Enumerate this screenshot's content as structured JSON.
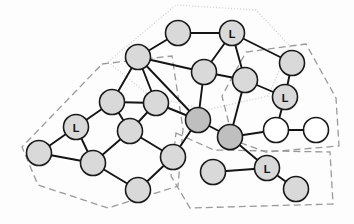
{
  "figure": {
    "name": "network-cluster-diagram",
    "kind": "node-link-graph",
    "width": 354,
    "height": 224,
    "background_color": "#fdfdfd"
  },
  "style": {
    "node_fill_gray": "#d9d9d9",
    "node_fill_dark": "#bfbfbf",
    "node_fill_white": "#ffffff",
    "node_stroke": "#1a1a1a",
    "node_stroke_width": 1.6,
    "node_radius": 12.5,
    "edge_color": "#141414",
    "edge_width": 1.9,
    "cluster_stroke": "#9a9a9a",
    "cluster_stroke_light": "#cccccc",
    "cluster_stroke_width": 1.3,
    "label_color": "#111111",
    "label_font_size": 11
  },
  "nodes": [
    {
      "id": "n1",
      "label": "",
      "x": 178,
      "y": 33,
      "fill": "#d9d9d9"
    },
    {
      "id": "n2",
      "label": "L",
      "x": 232,
      "y": 33,
      "fill": "#d9d9d9"
    },
    {
      "id": "n3",
      "label": "",
      "x": 138,
      "y": 57,
      "fill": "#d9d9d9"
    },
    {
      "id": "n4",
      "label": "",
      "x": 204,
      "y": 72,
      "fill": "#d9d9d9"
    },
    {
      "id": "n5",
      "label": "",
      "x": 245,
      "y": 80,
      "fill": "#d9d9d9"
    },
    {
      "id": "n6",
      "label": "",
      "x": 292,
      "y": 63,
      "fill": "#d9d9d9"
    },
    {
      "id": "n7",
      "label": "L",
      "x": 285,
      "y": 97,
      "fill": "#d9d9d9"
    },
    {
      "id": "n8",
      "label": "",
      "x": 112,
      "y": 102,
      "fill": "#d9d9d9"
    },
    {
      "id": "n9",
      "label": "",
      "x": 156,
      "y": 103,
      "fill": "#d9d9d9"
    },
    {
      "id": "n10",
      "label": "",
      "x": 198,
      "y": 120,
      "fill": "#bfbfbf"
    },
    {
      "id": "n11",
      "label": "L",
      "x": 76,
      "y": 127,
      "fill": "#d9d9d9"
    },
    {
      "id": "n12",
      "label": "",
      "x": 130,
      "y": 131,
      "fill": "#d9d9d9"
    },
    {
      "id": "n13",
      "label": "",
      "x": 230,
      "y": 137,
      "fill": "#bfbfbf"
    },
    {
      "id": "n14",
      "label": "",
      "x": 276,
      "y": 130,
      "fill": "#ffffff"
    },
    {
      "id": "n15",
      "label": "",
      "x": 316,
      "y": 130,
      "fill": "#ffffff"
    },
    {
      "id": "n16",
      "label": "",
      "x": 39,
      "y": 153,
      "fill": "#d9d9d9"
    },
    {
      "id": "n17",
      "label": "",
      "x": 93,
      "y": 163,
      "fill": "#d9d9d9"
    },
    {
      "id": "n18",
      "label": "",
      "x": 173,
      "y": 157,
      "fill": "#d9d9d9"
    },
    {
      "id": "n19",
      "label": "",
      "x": 213,
      "y": 172,
      "fill": "#d9d9d9"
    },
    {
      "id": "n20",
      "label": "L",
      "x": 267,
      "y": 168,
      "fill": "#d9d9d9"
    },
    {
      "id": "n21",
      "label": "",
      "x": 138,
      "y": 190,
      "fill": "#d9d9d9"
    },
    {
      "id": "n22",
      "label": "",
      "x": 296,
      "y": 189,
      "fill": "#d9d9d9"
    }
  ],
  "edges": [
    {
      "from": "n1",
      "to": "n2"
    },
    {
      "from": "n1",
      "to": "n3"
    },
    {
      "from": "n2",
      "to": "n4"
    },
    {
      "from": "n2",
      "to": "n5"
    },
    {
      "from": "n2",
      "to": "n6"
    },
    {
      "from": "n3",
      "to": "n4"
    },
    {
      "from": "n3",
      "to": "n8"
    },
    {
      "from": "n3",
      "to": "n9"
    },
    {
      "from": "n3",
      "to": "n10"
    },
    {
      "from": "n4",
      "to": "n5"
    },
    {
      "from": "n4",
      "to": "n10"
    },
    {
      "from": "n5",
      "to": "n7"
    },
    {
      "from": "n5",
      "to": "n13"
    },
    {
      "from": "n6",
      "to": "n7"
    },
    {
      "from": "n7",
      "to": "n14"
    },
    {
      "from": "n8",
      "to": "n9"
    },
    {
      "from": "n8",
      "to": "n11"
    },
    {
      "from": "n8",
      "to": "n12"
    },
    {
      "from": "n9",
      "to": "n12"
    },
    {
      "from": "n9",
      "to": "n10"
    },
    {
      "from": "n10",
      "to": "n13"
    },
    {
      "from": "n10",
      "to": "n18"
    },
    {
      "from": "n11",
      "to": "n16"
    },
    {
      "from": "n11",
      "to": "n17"
    },
    {
      "from": "n12",
      "to": "n17"
    },
    {
      "from": "n12",
      "to": "n18"
    },
    {
      "from": "n13",
      "to": "n14"
    },
    {
      "from": "n13",
      "to": "n20"
    },
    {
      "from": "n14",
      "to": "n15"
    },
    {
      "from": "n16",
      "to": "n17"
    },
    {
      "from": "n17",
      "to": "n21"
    },
    {
      "from": "n18",
      "to": "n21"
    },
    {
      "from": "n19",
      "to": "n20"
    },
    {
      "from": "n20",
      "to": "n22"
    }
  ],
  "clusters": [
    {
      "id": "cluster-top",
      "name": "top-dotted-region",
      "stroke": "#cfcfcf",
      "dash": "1,2",
      "points": "108,62 176,5 256,10 290,46 268,96 206,110 150,96"
    },
    {
      "id": "cluster-left",
      "name": "left-dashed-region",
      "stroke": "#9a9a9a",
      "dash": "7,4",
      "points": "102,64 172,56 183,129 178,186 108,208 38,185 22,147"
    },
    {
      "id": "cluster-right",
      "name": "right-dashed-region",
      "stroke": "#9a9a9a",
      "dash": "7,4",
      "points": "246,52 306,44 336,98 339,146 266,152 233,140 222,96"
    },
    {
      "id": "cluster-bottom",
      "name": "bottom-dashed-region",
      "stroke": "#9a9a9a",
      "dash": "7,4",
      "points": "176,133 214,150 330,152 333,204 190,208 171,176"
    }
  ]
}
